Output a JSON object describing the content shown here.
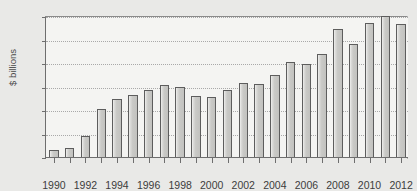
{
  "chart_data": {
    "type": "bar",
    "title": "",
    "xlabel": "",
    "ylabel": "$ billions",
    "ylim": [
      0,
      120
    ],
    "ytick_values": [
      0,
      20,
      40,
      60,
      80,
      100,
      120
    ],
    "ytick_labels": [
      "0",
      "20",
      "40",
      "60",
      "80",
      "100",
      "120"
    ],
    "grid": true,
    "grid_axis": "y",
    "legend": "none",
    "xtick_labels": [
      "1990",
      "1992",
      "1994",
      "1996",
      "1998",
      "2000",
      "2002",
      "2004",
      "2006",
      "2008",
      "2010",
      "2012"
    ],
    "categories": [
      "1990",
      "1991",
      "1992",
      "1993",
      "1994",
      "1995",
      "1996",
      "1997",
      "1998",
      "1999",
      "2000",
      "2001",
      "2002",
      "2003",
      "2004",
      "2005",
      "2006",
      "2007",
      "2008",
      "2009",
      "2010",
      "2011",
      "2012"
    ],
    "values": [
      6,
      8,
      18,
      41,
      49,
      53,
      57,
      61,
      60,
      52,
      51,
      57,
      63,
      62,
      70,
      81,
      79,
      88,
      109,
      96,
      114,
      120,
      113
    ],
    "bar_fill_color": "#c9c9c6",
    "bar_edge_color": "#5d5d5d",
    "plot_background": "#f4f4f2",
    "page_background": "#e9e9e7",
    "axis_color": "#6e6e6e",
    "gridline_color": "#a9a9a9"
  }
}
